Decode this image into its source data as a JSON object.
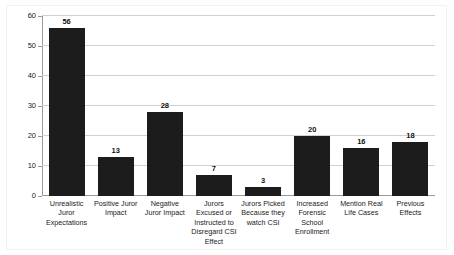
{
  "chart_data": {
    "type": "bar",
    "title": "",
    "subtitle": "",
    "xlabel": "",
    "ylabel": "",
    "ylim": [
      0,
      60
    ],
    "ytick_step": 10,
    "yticks": [
      0,
      10,
      20,
      30,
      40,
      50,
      60
    ],
    "ytick_labels": [
      "0",
      "10",
      "20",
      "30",
      "40",
      "50",
      "60"
    ],
    "grid": true,
    "grid_axis": "y",
    "legend": false,
    "legend_position": "none",
    "bar_color": "#1c1c1c",
    "gridline_color": "#d0d0d0",
    "axis_color": "#9a9a9a",
    "categories": [
      "Unrealistic\nJuror\nExpectations",
      "Positive Juror\nImpact",
      "Negative\nJuror Impact",
      "Jurors\nExcused or\nInstructed to\nDisregard CSI\nEffect",
      "Jurors Picked\nBecause they\nwatch CSI",
      "Increased\nForensic\nSchool\nEnrollment",
      "Mention Real\nLife Cases",
      "Previous\nEffects"
    ],
    "values": [
      56,
      13,
      28,
      7,
      3,
      20,
      16,
      18
    ],
    "value_labels": [
      "56",
      "13",
      "28",
      "7",
      "3",
      "20",
      "16",
      "18"
    ]
  }
}
